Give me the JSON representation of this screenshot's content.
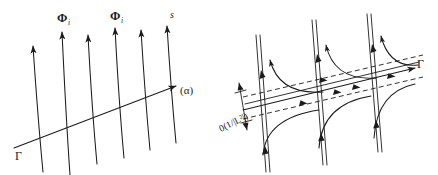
{
  "figure": {
    "caption_present": false,
    "background_color": "#ffffff",
    "ink_color": "#1c1c1c",
    "panels": [
      {
        "id": "left",
        "name": "transversal-flow-panel",
        "description": "Family of parallel upward trajectories crossing a transversal curve",
        "labels": [
          {
            "id": "phi-left",
            "text": "Φ",
            "subscript": "i",
            "x": 61,
            "y": 22
          },
          {
            "id": "phi-right",
            "text": "Φ",
            "subscript": "i",
            "x": 114,
            "y": 20
          },
          {
            "id": "s",
            "text": "s",
            "x": 172,
            "y": 18
          },
          {
            "id": "alpha",
            "text": "(α)",
            "x": 181,
            "y": 94
          },
          {
            "id": "gamma",
            "text": "Γ",
            "x": 17,
            "y": 158
          }
        ],
        "trajectory_count": 6,
        "transversal_label": "Γ",
        "direction_label": "(α)"
      },
      {
        "id": "right",
        "name": "hyperbolic-crossing-panel",
        "description": "Three hyperbolic branch pairs crossing a banded transversal line with dashed envelopes",
        "labels": [
          {
            "id": "gamma-right",
            "text": "Γ",
            "x": 198,
            "y": 67
          },
          {
            "id": "order-term",
            "text": "0(1/|L²|)",
            "x": 4,
            "y": 118,
            "rotation": -27
          }
        ],
        "asymptote_count": 3,
        "band_dashed_lines": 2,
        "band_width_annotation": "0(1/|L²|)",
        "transversal_label": "Γ"
      }
    ]
  }
}
